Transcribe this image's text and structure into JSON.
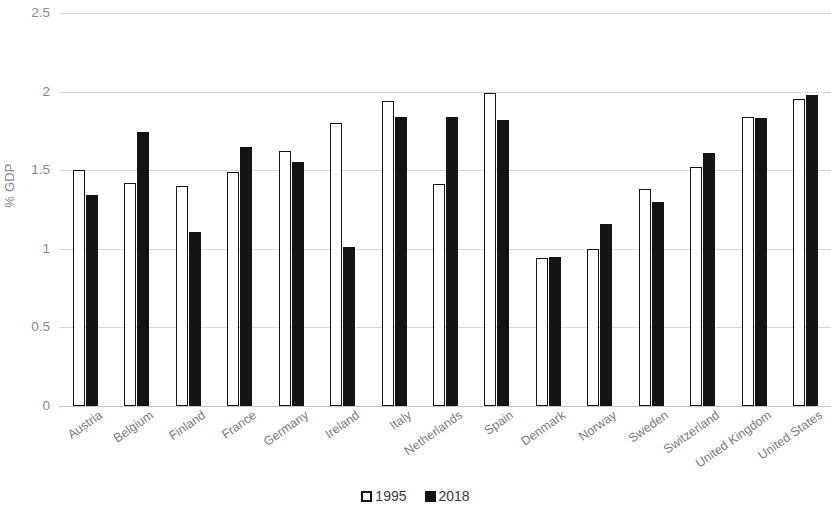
{
  "chart_data": {
    "type": "bar",
    "title": "",
    "subtitle": "",
    "xlabel": "",
    "ylabel": "% GDP",
    "ylim": [
      0,
      2.5
    ],
    "y_ticks": [
      "0",
      "0.5",
      "1",
      "1.5",
      "2",
      "2.5"
    ],
    "y_tick_values": [
      0,
      0.5,
      1,
      1.5,
      2,
      2.5
    ],
    "grid": true,
    "legend_position": "bottom-center",
    "categories": [
      "Austria",
      "Belgium",
      "Finland",
      "France",
      "Germany",
      "Ireland",
      "Italy",
      "Netherlands",
      "Spain",
      "Denmark",
      "Norway",
      "Sweden",
      "Switzerland",
      "United Kingdom",
      "United States"
    ],
    "series": [
      {
        "name": "1995",
        "color": "#ffffff",
        "edge_color": "#141414",
        "style": "hollow",
        "values": [
          1.5,
          1.42,
          1.4,
          1.49,
          1.62,
          1.8,
          1.94,
          1.41,
          1.99,
          0.94,
          1.0,
          1.38,
          1.52,
          1.84,
          1.95
        ]
      },
      {
        "name": "2018",
        "color": "#141414",
        "edge_color": "#141414",
        "style": "solid",
        "values": [
          1.34,
          1.74,
          1.11,
          1.65,
          1.55,
          1.01,
          1.84,
          1.84,
          1.82,
          0.95,
          1.16,
          1.3,
          1.61,
          1.83,
          1.98
        ]
      }
    ]
  },
  "legend": {
    "items": [
      {
        "label": "1995",
        "style": "hollow"
      },
      {
        "label": "2018",
        "style": "solid"
      }
    ]
  },
  "colors": {
    "gridline": "#d9d9d9",
    "axis": "#c6c6c6",
    "tick_text": "#8a8a8a",
    "category_text": "#7d7d7d",
    "legend_text": "#3c3c3c",
    "bar_1995_fill": "#ffffff",
    "bar_2018_fill": "#141414",
    "background": "#ffffff"
  }
}
